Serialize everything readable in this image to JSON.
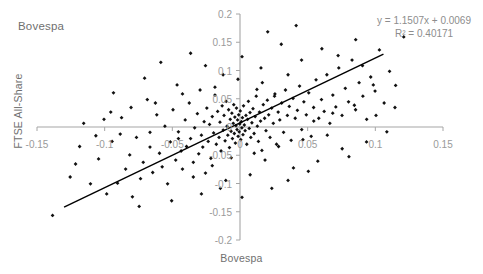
{
  "chart_data": {
    "type": "scatter",
    "title": "Bovespa",
    "xlabel": "Bovespa",
    "ylabel": "FTSE All-Share",
    "xlim": [
      -0.15,
      0.15
    ],
    "ylim": [
      -0.2,
      0.2
    ],
    "xticks": [
      "-0.15",
      "-0.1",
      "-0.05",
      "0",
      "0.05",
      "0.1",
      "0.15"
    ],
    "xtick_values": [
      -0.15,
      -0.1,
      -0.05,
      0,
      0.05,
      0.1,
      0.15
    ],
    "yticks": [
      "-0.2",
      "-0.15",
      "-0.1",
      "-0.05",
      "0",
      "0.05",
      "0.1",
      "0.15",
      "0.2"
    ],
    "ytick_values": [
      -0.2,
      -0.15,
      -0.1,
      -0.05,
      0,
      0.05,
      0.1,
      0.15,
      0.2
    ],
    "grid": false,
    "legend": "none",
    "marker": "diamond",
    "marker_color": "#111111",
    "axis_color": "#a6a6a6",
    "trendline_color": "#000000",
    "annotations": {
      "equation": "y = 1.1507x + 0.0069",
      "r_squared": "R² = 0.40171"
    },
    "fit": {
      "slope": 1.1507,
      "intercept": 0.0069,
      "r2": 0.40171
    },
    "trendline_endpoints": [
      [
        -0.13,
        -0.142
      ],
      [
        0.106,
        0.129
      ]
    ],
    "series": [
      {
        "name": "Bovespa vs FTSE All-Share",
        "points": [
          [
            -0.1385,
            -0.1565
          ],
          [
            -0.1255,
            -0.0885
          ],
          [
            -0.1215,
            -0.0655
          ],
          [
            -0.1105,
            -0.1005
          ],
          [
            -0.1045,
            -0.0565
          ],
          [
            -0.1005,
            0.0135
          ],
          [
            -0.0985,
            -0.1185
          ],
          [
            -0.0945,
            -0.0255
          ],
          [
            -0.0905,
            -0.0995
          ],
          [
            -0.0875,
            0.0165
          ],
          [
            -0.0845,
            -0.0745
          ],
          [
            -0.0815,
            -0.0495
          ],
          [
            -0.0795,
            -0.1235
          ],
          [
            -0.0765,
            -0.0185
          ],
          [
            -0.0735,
            -0.0915
          ],
          [
            -0.0715,
            -0.0625
          ],
          [
            -0.0685,
            0.0485
          ],
          [
            -0.0665,
            -0.0355
          ],
          [
            -0.0645,
            -0.0805
          ],
          [
            -0.0615,
            0.0215
          ],
          [
            -0.0595,
            -0.0465
          ],
          [
            -0.0575,
            -0.0705
          ],
          [
            -0.0555,
            0.0015
          ],
          [
            -0.0535,
            -0.1005
          ],
          [
            -0.0515,
            -0.0265
          ],
          [
            -0.0495,
            0.0305
          ],
          [
            -0.0475,
            -0.0585
          ],
          [
            -0.0455,
            -0.0085
          ],
          [
            -0.0435,
            -0.0425
          ],
          [
            -0.0425,
            -0.0745
          ],
          [
            -0.0405,
            0.0125
          ],
          [
            -0.0395,
            -0.0345
          ],
          [
            -0.0375,
            0.0425
          ],
          [
            -0.0365,
            -0.0205
          ],
          [
            -0.0345,
            -0.0625
          ],
          [
            -0.0335,
            -0.0015
          ],
          [
            -0.0315,
            0.0235
          ],
          [
            -0.0305,
            -0.0475
          ],
          [
            -0.0295,
            0.0655
          ],
          [
            -0.0285,
            -0.0145
          ],
          [
            -0.0275,
            -0.0355
          ],
          [
            -0.0265,
            0.0095
          ],
          [
            -0.0255,
            -0.0815
          ],
          [
            -0.0245,
            0.0335
          ],
          [
            -0.0235,
            -0.0255
          ],
          [
            -0.0225,
            0.0045
          ],
          [
            -0.0215,
            -0.0555
          ],
          [
            -0.0205,
            0.0185
          ],
          [
            -0.0195,
            -0.0105
          ],
          [
            -0.0185,
            0.0565
          ],
          [
            -0.0175,
            -0.0305
          ],
          [
            -0.0165,
            0.0275
          ],
          [
            -0.0155,
            -0.0185
          ],
          [
            -0.0148,
            0.0085
          ],
          [
            -0.014,
            -0.0425
          ],
          [
            -0.0132,
            0.0375
          ],
          [
            -0.0124,
            -0.0055
          ],
          [
            -0.0118,
            0.0205
          ],
          [
            -0.011,
            -0.0245
          ],
          [
            -0.0102,
            0.0455
          ],
          [
            -0.0096,
            0.0015
          ],
          [
            -0.009,
            -0.0145
          ],
          [
            -0.0084,
            0.0305
          ],
          [
            -0.0078,
            -0.0365
          ],
          [
            -0.0072,
            0.0135
          ],
          [
            -0.0066,
            -0.0075
          ],
          [
            -0.006,
            0.0245
          ],
          [
            -0.0056,
            -0.0205
          ],
          [
            -0.005,
            0.0065
          ],
          [
            -0.0046,
            0.0395
          ],
          [
            -0.0042,
            -0.0115
          ],
          [
            -0.0038,
            0.0175
          ],
          [
            -0.0034,
            -0.0285
          ],
          [
            -0.003,
            0.0025
          ],
          [
            -0.0026,
            0.0335
          ],
          [
            -0.0022,
            -0.0045
          ],
          [
            -0.0018,
            0.0125
          ],
          [
            -0.0014,
            -0.0165
          ],
          [
            -0.001,
            0.0215
          ],
          [
            -0.0006,
            -0.0085
          ],
          [
            -0.0002,
            0.0055
          ],
          [
            0.0002,
            0.0285
          ],
          [
            0.0006,
            -0.0225
          ],
          [
            0.001,
            0.0095
          ],
          [
            0.0014,
            -0.0015
          ],
          [
            0.0018,
            0.0165
          ],
          [
            0.0022,
            -0.0135
          ],
          [
            0.0026,
            0.0375
          ],
          [
            0.0032,
            0.0035
          ],
          [
            0.0038,
            -0.0065
          ],
          [
            0.0044,
            0.0205
          ],
          [
            0.005,
            -0.0305
          ],
          [
            0.0056,
            0.0135
          ],
          [
            0.0062,
            0.0455
          ],
          [
            0.0068,
            -0.0025
          ],
          [
            0.0074,
            0.0255
          ],
          [
            0.008,
            -0.0185
          ],
          [
            0.0088,
            0.0075
          ],
          [
            0.0096,
            0.0325
          ],
          [
            0.0104,
            -0.0115
          ],
          [
            0.0112,
            0.0185
          ],
          [
            0.012,
            0.0545
          ],
          [
            0.0128,
            0.0015
          ],
          [
            0.0136,
            -0.0255
          ],
          [
            0.0144,
            0.0265
          ],
          [
            0.0152,
            0.0105
          ],
          [
            0.0162,
            -0.0415
          ],
          [
            0.0172,
            0.0395
          ],
          [
            0.0182,
            0.0155
          ],
          [
            0.0192,
            -0.0065
          ],
          [
            0.0202,
            0.0475
          ],
          [
            0.0212,
            0.0215
          ],
          [
            0.0222,
            -0.0185
          ],
          [
            0.0234,
            0.0335
          ],
          [
            0.0246,
            0.0065
          ],
          [
            0.0258,
            0.0585
          ],
          [
            0.027,
            -0.0305
          ],
          [
            0.0282,
            0.0265
          ],
          [
            0.0294,
            0.0125
          ],
          [
            0.0308,
            0.0425
          ],
          [
            0.0322,
            -0.0095
          ],
          [
            0.0336,
            0.0655
          ],
          [
            0.035,
            0.0205
          ],
          [
            0.0364,
            0.0365
          ],
          [
            0.0378,
            -0.0235
          ],
          [
            0.0392,
            0.0505
          ],
          [
            0.0408,
            0.0155
          ],
          [
            0.0424,
            0.0295
          ],
          [
            0.044,
            0.0725
          ],
          [
            0.0456,
            -0.0045
          ],
          [
            0.0472,
            0.0445
          ],
          [
            0.049,
            0.0215
          ],
          [
            0.0508,
            0.0605
          ],
          [
            0.0526,
            -0.0165
          ],
          [
            0.0544,
            0.0345
          ],
          [
            0.0562,
            0.0835
          ],
          [
            0.0582,
            0.0155
          ],
          [
            0.0602,
            0.0485
          ],
          [
            0.0622,
            0.0275
          ],
          [
            0.0642,
            0.0925
          ],
          [
            0.0664,
            0.0065
          ],
          [
            0.0686,
            0.0565
          ],
          [
            0.0708,
            0.0355
          ],
          [
            0.073,
            0.1045
          ],
          [
            0.0754,
            0.0205
          ],
          [
            0.0778,
            0.0685
          ],
          [
            0.0802,
            0.0445
          ],
          [
            0.0828,
            0.1185
          ],
          [
            0.0854,
            0.0305
          ],
          [
            0.088,
            0.0785
          ],
          [
            0.0908,
            0.0545
          ],
          [
            0.0936,
            0.0135
          ],
          [
            0.0966,
            0.0885
          ],
          [
            0.0998,
            0.0635
          ],
          [
            0.103,
            0.1365
          ],
          [
            0.1065,
            0.0425
          ],
          [
            0.1105,
            0.0985
          ],
          [
            0.115,
            0.0735
          ],
          [
            0.121,
            0.1595
          ],
          [
            -0.1155,
            0.0065
          ],
          [
            -0.0935,
            0.0605
          ],
          [
            -0.0705,
            0.0865
          ],
          [
            -0.0465,
            0.0745
          ],
          [
            -0.0255,
            0.1085
          ],
          [
            -0.0125,
            0.0925
          ],
          [
            0.0015,
            0.1245
          ],
          [
            0.0155,
            0.1045
          ],
          [
            0.0305,
            0.1465
          ],
          [
            0.0455,
            0.1185
          ],
          [
            0.0605,
            0.1385
          ],
          [
            0.0205,
            0.1685
          ],
          [
            0.0855,
            0.1545
          ],
          [
            0.0415,
            0.1795
          ],
          [
            0.0725,
            0.1265
          ],
          [
            -0.0365,
            0.1305
          ],
          [
            -0.0585,
            0.1145
          ],
          [
            0.0165,
            0.0785
          ],
          [
            -0.0015,
            0.0845
          ],
          [
            0.0355,
            0.0925
          ],
          [
            -0.0185,
            0.0705
          ],
          [
            -0.0805,
            0.0345
          ],
          [
            -0.0625,
            0.0425
          ],
          [
            -0.0425,
            0.0585
          ],
          [
            0.0125,
            0.0665
          ],
          [
            0.0255,
            0.0545
          ],
          [
            -0.0955,
            0.0265
          ],
          [
            0.0545,
            0.0105
          ],
          [
            0.0685,
            0.0245
          ],
          [
            0.0845,
            0.0385
          ],
          [
            0.1005,
            0.0205
          ],
          [
            -0.1065,
            -0.0155
          ],
          [
            -0.0745,
            -0.1405
          ],
          [
            -0.0505,
            -0.1305
          ],
          [
            -0.0285,
            -0.1185
          ],
          [
            -0.0105,
            -0.0945
          ],
          [
            0.0075,
            -0.0845
          ],
          [
            0.0235,
            -0.1085
          ],
          [
            0.0395,
            -0.0725
          ],
          [
            0.0575,
            -0.0605
          ],
          [
            0.0755,
            -0.0385
          ],
          [
            0.0935,
            -0.0265
          ],
          [
            -0.0205,
            -0.0685
          ],
          [
            -0.0065,
            -0.0545
          ],
          [
            0.0105,
            -0.0465
          ],
          [
            0.0285,
            -0.0345
          ],
          [
            0.0465,
            -0.0225
          ],
          [
            0.0645,
            -0.0145
          ],
          [
            -0.0345,
            -0.0885
          ],
          [
            0.0185,
            -0.0585
          ],
          [
            0.0355,
            -0.0945
          ],
          [
            -0.0145,
            -0.1085
          ],
          [
            0.0015,
            -0.1245
          ],
          [
            -0.0455,
            -0.0205
          ],
          [
            0.0505,
            -0.0785
          ],
          [
            0.0805,
            -0.0525
          ],
          [
            -0.1185,
            -0.0345
          ],
          [
            -0.0885,
            -0.0125
          ],
          [
            -0.0665,
            -0.0095
          ],
          [
            0.1085,
            -0.0085
          ],
          [
            0.0905,
            0.1085
          ],
          [
            0.0985,
            0.0745
          ],
          [
            0.1145,
            0.0345
          ]
        ]
      }
    ]
  }
}
